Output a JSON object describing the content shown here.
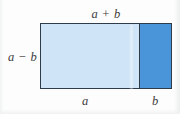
{
  "figure": {
    "type": "geometric-diagram",
    "colors": {
      "background": "#fdfdfd",
      "region_a_fill": "#cfe4f6",
      "region_b_fill": "#4a94da",
      "outline": "#2e3c4c",
      "label_text": "#3b3b3b"
    },
    "labels": {
      "top": "a + b",
      "left": "a − b",
      "bottom_left": "a",
      "bottom_right": "b"
    },
    "regions": [
      {
        "id": "region-a",
        "label": "a",
        "fill": "#cfe4f6",
        "width_fraction": 0.74
      },
      {
        "id": "region-b",
        "label": "b",
        "fill": "#4a94da",
        "width_fraction": 0.26
      }
    ]
  }
}
